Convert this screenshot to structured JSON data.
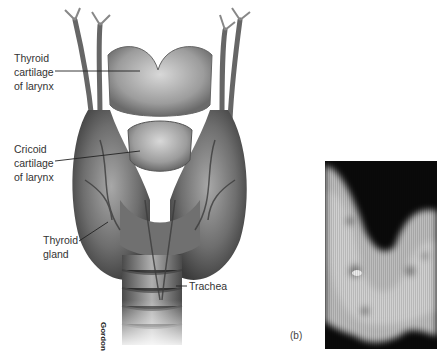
{
  "figure": {
    "labels": {
      "thyroid_cartilage": [
        "Thyroid",
        "cartilage",
        "of larynx"
      ],
      "cricoid_cartilage": [
        "Cricoid",
        "cartilage",
        "of larynx"
      ],
      "thyroid_gland": [
        "Thyroid",
        "gland"
      ],
      "trachea": "Trachea"
    },
    "credit": "Gordon",
    "panel_label": "(b)"
  }
}
